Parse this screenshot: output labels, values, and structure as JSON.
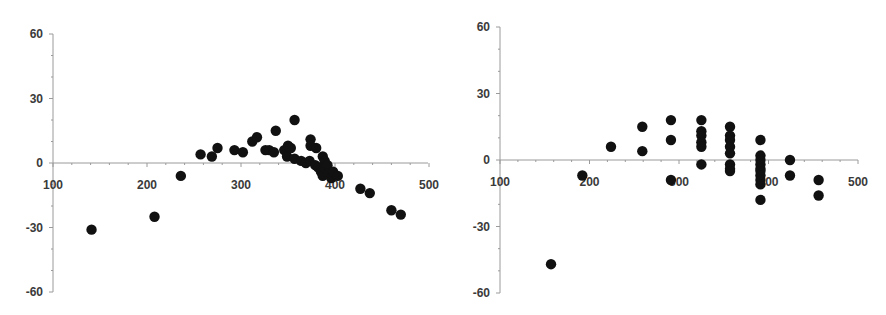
{
  "chart_data": [
    {
      "type": "scatter",
      "title": "",
      "xlabel": "",
      "ylabel": "",
      "xlim": [
        100,
        500
      ],
      "ylim": [
        -60,
        60
      ],
      "xticks": [
        100,
        200,
        300,
        400,
        500
      ],
      "yticks": [
        60,
        30,
        0,
        -30,
        -60
      ],
      "xtick_labels": [
        "100",
        "200",
        "300",
        "400",
        "500"
      ],
      "ytick_labels": [
        "60",
        "30",
        "0",
        "-30",
        "-60"
      ],
      "grid": false,
      "legend": null,
      "marker_color": "#111111",
      "axis_color": "#9a9a9a",
      "layout": {
        "origin_px": [
          53,
          163
        ],
        "x_px_per_100": 94,
        "y_px_per_30": 64.5,
        "top_px": 34,
        "bottom_px": 292,
        "right_px": 428
      },
      "points": [
        {
          "x": 141,
          "y": -31
        },
        {
          "x": 208,
          "y": -25
        },
        {
          "x": 236,
          "y": -6
        },
        {
          "x": 257,
          "y": 4
        },
        {
          "x": 269,
          "y": 3
        },
        {
          "x": 275,
          "y": 7
        },
        {
          "x": 293,
          "y": 6
        },
        {
          "x": 302,
          "y": 5
        },
        {
          "x": 312,
          "y": 10
        },
        {
          "x": 317,
          "y": 12
        },
        {
          "x": 326,
          "y": 6
        },
        {
          "x": 330,
          "y": 6
        },
        {
          "x": 335,
          "y": 5
        },
        {
          "x": 337,
          "y": 15
        },
        {
          "x": 346,
          "y": 6
        },
        {
          "x": 349,
          "y": 3
        },
        {
          "x": 350,
          "y": 8
        },
        {
          "x": 353,
          "y": 7
        },
        {
          "x": 357,
          "y": 20
        },
        {
          "x": 357,
          "y": 2
        },
        {
          "x": 364,
          "y": 1
        },
        {
          "x": 369,
          "y": 0
        },
        {
          "x": 373,
          "y": 1
        },
        {
          "x": 374,
          "y": 11
        },
        {
          "x": 374,
          "y": 8
        },
        {
          "x": 380,
          "y": 7
        },
        {
          "x": 379,
          "y": -1
        },
        {
          "x": 382,
          "y": -2
        },
        {
          "x": 385,
          "y": -4
        },
        {
          "x": 387,
          "y": 3
        },
        {
          "x": 387,
          "y": -6
        },
        {
          "x": 389,
          "y": 1
        },
        {
          "x": 390,
          "y": -3
        },
        {
          "x": 392,
          "y": -1
        },
        {
          "x": 393,
          "y": -5
        },
        {
          "x": 396,
          "y": -7
        },
        {
          "x": 398,
          "y": -4
        },
        {
          "x": 403,
          "y": -6
        },
        {
          "x": 427,
          "y": -12
        },
        {
          "x": 437,
          "y": -14
        },
        {
          "x": 460,
          "y": -22
        },
        {
          "x": 470,
          "y": -24
        }
      ]
    },
    {
      "type": "scatter",
      "title": "",
      "xlabel": "",
      "ylabel": "",
      "xlim": [
        100,
        500
      ],
      "ylim": [
        -60,
        60
      ],
      "xticks": [
        100,
        200,
        300,
        400,
        500
      ],
      "yticks": [
        60,
        30,
        0,
        -30,
        -60
      ],
      "xtick_labels": [
        "100",
        "200",
        "300",
        "400",
        "500"
      ],
      "ytick_labels": [
        "60",
        "30",
        "0",
        "-30",
        "-60"
      ],
      "grid": false,
      "legend": null,
      "marker_color": "#111111",
      "axis_color": "#9a9a9a",
      "layout": {
        "origin_px": [
          57,
          160
        ],
        "x_px_per_100": 89.5,
        "y_px_per_30": 66.5,
        "top_px": 27,
        "bottom_px": 293,
        "right_px": 415
      },
      "points": [
        {
          "x": 157,
          "y": -47
        },
        {
          "x": 192,
          "y": -7
        },
        {
          "x": 224,
          "y": 6
        },
        {
          "x": 259,
          "y": 15
        },
        {
          "x": 259,
          "y": 4
        },
        {
          "x": 291,
          "y": 18
        },
        {
          "x": 291,
          "y": 9
        },
        {
          "x": 291,
          "y": -9
        },
        {
          "x": 325,
          "y": 18
        },
        {
          "x": 325,
          "y": 13
        },
        {
          "x": 325,
          "y": 11
        },
        {
          "x": 325,
          "y": 8
        },
        {
          "x": 325,
          "y": 6
        },
        {
          "x": 325,
          "y": -2
        },
        {
          "x": 357,
          "y": 15
        },
        {
          "x": 357,
          "y": 11
        },
        {
          "x": 357,
          "y": 9
        },
        {
          "x": 357,
          "y": 6
        },
        {
          "x": 357,
          "y": 3
        },
        {
          "x": 357,
          "y": -2
        },
        {
          "x": 357,
          "y": -4
        },
        {
          "x": 357,
          "y": -5
        },
        {
          "x": 391,
          "y": 9
        },
        {
          "x": 391,
          "y": 2
        },
        {
          "x": 391,
          "y": 0
        },
        {
          "x": 391,
          "y": -2
        },
        {
          "x": 391,
          "y": -4
        },
        {
          "x": 391,
          "y": -5
        },
        {
          "x": 391,
          "y": -7
        },
        {
          "x": 391,
          "y": -9
        },
        {
          "x": 391,
          "y": -11
        },
        {
          "x": 391,
          "y": -18
        },
        {
          "x": 424,
          "y": 0
        },
        {
          "x": 424,
          "y": -7
        },
        {
          "x": 456,
          "y": -9
        },
        {
          "x": 456,
          "y": -16
        }
      ]
    }
  ]
}
